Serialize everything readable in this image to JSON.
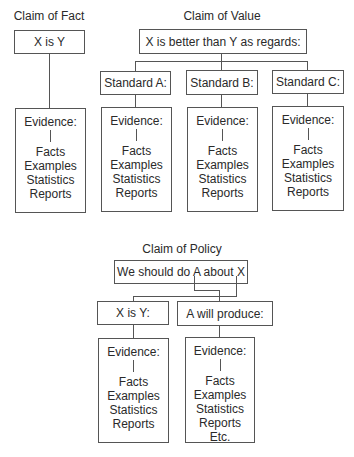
{
  "fact": {
    "title": "Claim of Fact",
    "claim": "X is Y",
    "evidence": {
      "label": "Evidence:",
      "items": [
        "Facts",
        "Examples",
        "Statistics",
        "Reports"
      ]
    }
  },
  "value": {
    "title": "Claim of Value",
    "claim": "X is better than Y as regards:",
    "standards": [
      {
        "label": "Standard A:",
        "evidence": {
          "label": "Evidence:",
          "items": [
            "Facts",
            "Examples",
            "Statistics",
            "Reports"
          ]
        }
      },
      {
        "label": "Standard B:",
        "evidence": {
          "label": "Evidence:",
          "items": [
            "Facts",
            "Examples",
            "Statistics",
            "Reports"
          ]
        }
      },
      {
        "label": "Standard C:",
        "evidence": {
          "label": "Evidence:",
          "items": [
            "Facts",
            "Examples",
            "Statistics",
            "Reports"
          ]
        }
      }
    ]
  },
  "policy": {
    "title": "Claim of Policy",
    "claim": "We should do A about X",
    "branches": [
      {
        "label": "X is Y:",
        "evidence": {
          "label": "Evidence:",
          "items": [
            "Facts",
            "Examples",
            "Statistics",
            "Reports"
          ]
        }
      },
      {
        "label": "A will produce:",
        "evidence": {
          "label": "Evidence:",
          "items": [
            "Facts",
            "Examples",
            "Statistics",
            "Reports",
            "Etc."
          ]
        }
      }
    ]
  }
}
